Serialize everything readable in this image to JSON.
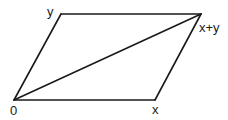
{
  "diagram": {
    "stroke_color": "#1a1a1a",
    "background": "#ffffff",
    "points": {
      "origin": {
        "label": "0",
        "x": 14,
        "y": 100
      },
      "x": {
        "label": "x",
        "x": 155,
        "y": 100
      },
      "y": {
        "label": "y",
        "x": 61,
        "y": 14
      },
      "sum": {
        "label": "x+y",
        "x": 201,
        "y": 14
      }
    },
    "edges": [
      {
        "name": "edge-origin-to-x",
        "from": "origin",
        "to": "x"
      },
      {
        "name": "edge-origin-to-y",
        "from": "origin",
        "to": "y"
      },
      {
        "name": "edge-y-to-sum",
        "from": "y",
        "to": "sum"
      },
      {
        "name": "edge-x-to-sum",
        "from": "x",
        "to": "sum"
      },
      {
        "name": "diagonal-origin-to-sum",
        "from": "origin",
        "to": "sum"
      }
    ]
  }
}
